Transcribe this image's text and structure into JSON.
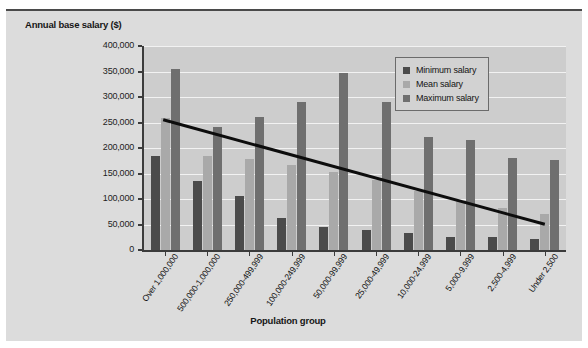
{
  "figure": {
    "background_color": "#dcdcdc",
    "plot_background_color": "#cdcdcd"
  },
  "legend": {
    "position": "top-right",
    "entries": [
      {
        "label": "Minimum salary",
        "color": "#4b4b4b",
        "swatch_name": "legend-swatch-minimum"
      },
      {
        "label": "Mean salary",
        "color": "#a9a9a9",
        "swatch_name": "legend-swatch-mean"
      },
      {
        "label": "Maximum salary",
        "color": "#6f6f6f",
        "swatch_name": "legend-swatch-maximum"
      }
    ]
  },
  "chart_data": {
    "type": "bar",
    "title": "",
    "xlabel": "Population group",
    "ylabel": "Annual base salary ($)",
    "ylim": [
      0,
      400000
    ],
    "ytick_step": 50000,
    "ytick_labels": [
      "0",
      "50,000",
      "100,000",
      "150,000",
      "200,000",
      "250,000",
      "300,000",
      "350,000",
      "400,000"
    ],
    "ytick_values": [
      0,
      50000,
      100000,
      150000,
      200000,
      250000,
      300000,
      350000,
      400000
    ],
    "grid": true,
    "grid_axis": "y",
    "categories": [
      "Over 1,000,000",
      "500,000-1,000,000",
      "250,000-499,999",
      "100,000-249,999",
      "50,000-99,999",
      "25,000-49,999",
      "10,000-24,999",
      "5,000-9,999",
      "2,500-4,999",
      "Under 2,500"
    ],
    "series": [
      {
        "name": "Minimum salary",
        "color": "#4b4b4b",
        "values": [
          185000,
          135000,
          105000,
          62000,
          46000,
          39000,
          33000,
          26000,
          25000,
          22000
        ]
      },
      {
        "name": "Mean salary",
        "color": "#a9a9a9",
        "values": [
          258000,
          185000,
          178000,
          166000,
          152000,
          138000,
          116000,
          97000,
          83000,
          70000
        ]
      },
      {
        "name": "Maximum salary",
        "color": "#6f6f6f",
        "values": [
          355000,
          242000,
          261000,
          290000,
          348000,
          291000,
          221000,
          215000,
          181000,
          176000
        ]
      }
    ],
    "annotations": [
      {
        "name": "mean-trendline",
        "type": "line",
        "color": "#0d0d0d",
        "width_px": 3,
        "start": {
          "category_index": 0,
          "value": 257000
        },
        "end": {
          "category_index": 9,
          "value": 53000
        }
      }
    ]
  }
}
